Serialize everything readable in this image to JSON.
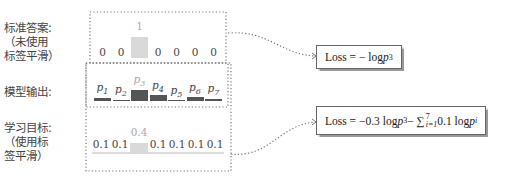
{
  "labels": {
    "gold": [
      "标准答案:",
      "（未使用",
      "标签平滑）"
    ],
    "model": "模型输出:",
    "target": [
      "学习目标:",
      "（使用标",
      "签平滑）"
    ]
  },
  "gold_row": {
    "values": [
      "0",
      "0",
      "1",
      "0",
      "0",
      "0",
      "0"
    ],
    "highlight_index": 2,
    "highlight_color": "#d9d9d9"
  },
  "model_row": {
    "labels": [
      "p1",
      "p2",
      "p3",
      "p4",
      "p5",
      "p6",
      "p7"
    ],
    "bar_heights_px": [
      3,
      1,
      11,
      6,
      1,
      4,
      2
    ],
    "bar_color": "#555555",
    "highlight_index": 2
  },
  "target_row": {
    "values": [
      "0.1",
      "0.1",
      "0.4",
      "0.1",
      "0.1",
      "0.1",
      "0.1"
    ],
    "highlight_index": 2,
    "highlight_color": "#d9d9d9",
    "baseline_color": "#dddddd"
  },
  "loss_boxes": {
    "top": {
      "prefix": "Loss = − log ",
      "var": "p",
      "sub": "3"
    },
    "bottom": {
      "prefix": "Loss = −0.3 log ",
      "var": "p",
      "sub": "3",
      "mid": " − ∑",
      "sum_sub": "i=1",
      "sum_sup": "7",
      "tail": " 0.1 log ",
      "tail_var": "p",
      "tail_sub": "i"
    }
  },
  "colors": {
    "dotted": "#777777",
    "text": "#444444"
  }
}
